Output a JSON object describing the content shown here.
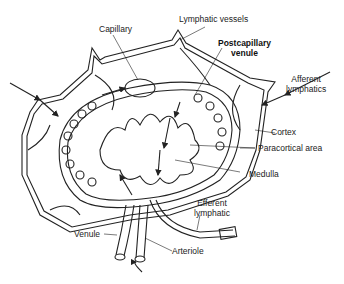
{
  "diagram": {
    "labels": {
      "capillary": "Capillary",
      "lymphatic_vessels": "Lymphatic vessels",
      "postcapillary_venule_line1": "Postcapillary",
      "postcapillary_venule_line2": "venule",
      "afferent_lymphatics_line1": "Afferent",
      "afferent_lymphatics_line2": "lymphatics",
      "cortex": "Cortex",
      "paracortical_area": "Paracortical area",
      "medulla": "Medulla",
      "efferent_lymphatic_line1": "Efferent",
      "efferent_lymphatic_line2": "lymphatic",
      "venule": "Venule",
      "arteriole": "Arteriole"
    },
    "colors": {
      "line": "#222222",
      "background": "#ffffff"
    }
  }
}
